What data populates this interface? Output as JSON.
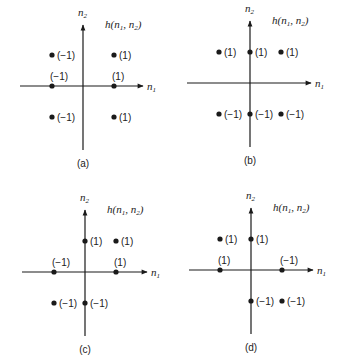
{
  "figure": {
    "panels": [
      {
        "id": "a",
        "caption": "(a)",
        "title": "h(n1, n2)",
        "origin": [
          83,
          86
        ],
        "axis": {
          "x_from": 20,
          "x_to": 143,
          "y_from": 25,
          "y_to": 150
        },
        "points": [
          {
            "dx": -1,
            "dy": 1,
            "value": "(−1)",
            "label_pos": "right"
          },
          {
            "dx": 1,
            "dy": 1,
            "value": "(1)",
            "label_pos": "right"
          },
          {
            "dx": -1,
            "dy": 0,
            "value": "(−1)",
            "label_pos": "above"
          },
          {
            "dx": 1,
            "dy": 0,
            "value": "(1)",
            "label_pos": "above"
          },
          {
            "dx": -1,
            "dy": -1,
            "value": "(−1)",
            "label_pos": "right"
          },
          {
            "dx": 1,
            "dy": -1,
            "value": "(1)",
            "label_pos": "right"
          }
        ]
      },
      {
        "id": "b",
        "caption": "(b)",
        "title": "h(n1, n2)",
        "origin": [
          250,
          83
        ],
        "axis": {
          "x_from": 187,
          "x_to": 311,
          "y_from": 21,
          "y_to": 147
        },
        "points": [
          {
            "dx": -1,
            "dy": 1,
            "value": "(1)",
            "label_pos": "right"
          },
          {
            "dx": 0,
            "dy": 1,
            "value": "(1)",
            "label_pos": "right"
          },
          {
            "dx": 1,
            "dy": 1,
            "value": "(1)",
            "label_pos": "right"
          },
          {
            "dx": -1,
            "dy": -1,
            "value": "(−1)",
            "label_pos": "right"
          },
          {
            "dx": 0,
            "dy": -1,
            "value": "(−1)",
            "label_pos": "right"
          },
          {
            "dx": 1,
            "dy": -1,
            "value": "(−1)",
            "label_pos": "right"
          }
        ]
      },
      {
        "id": "c",
        "caption": "(c)",
        "title": "h(n1, n2)",
        "origin": [
          85,
          272
        ],
        "axis": {
          "x_from": 22,
          "x_to": 147,
          "y_from": 210,
          "y_to": 336
        },
        "points": [
          {
            "dx": 0,
            "dy": 1,
            "value": "(1)",
            "label_pos": "right"
          },
          {
            "dx": 1,
            "dy": 1,
            "value": "(1)",
            "label_pos": "right"
          },
          {
            "dx": -1,
            "dy": 0,
            "value": "(−1)",
            "label_pos": "above"
          },
          {
            "dx": 1,
            "dy": 0,
            "value": "(1)",
            "label_pos": "above"
          },
          {
            "dx": -1,
            "dy": -1,
            "value": "(−1)",
            "label_pos": "right"
          },
          {
            "dx": 0,
            "dy": -1,
            "value": "(−1)",
            "label_pos": "right"
          }
        ]
      },
      {
        "id": "d",
        "caption": "(d)",
        "title": "h(n1, n2)",
        "origin": [
          251,
          270
        ],
        "axis": {
          "x_from": 189,
          "x_to": 313,
          "y_from": 208,
          "y_to": 334
        },
        "points": [
          {
            "dx": -1,
            "dy": 1,
            "value": "(1)",
            "label_pos": "right"
          },
          {
            "dx": 0,
            "dy": 1,
            "value": "(1)",
            "label_pos": "right"
          },
          {
            "dx": -1,
            "dy": 0,
            "value": "(1)",
            "label_pos": "above"
          },
          {
            "dx": 1,
            "dy": 0,
            "value": "(−1)",
            "label_pos": "above"
          },
          {
            "dx": 0,
            "dy": -1,
            "value": "(−1)",
            "label_pos": "right"
          },
          {
            "dx": 1,
            "dy": -1,
            "value": "(−1)",
            "label_pos": "right"
          }
        ]
      }
    ],
    "axis_labels": {
      "horizontal": "n",
      "horizontal_sub": "1",
      "vertical": "n",
      "vertical_sub": "2"
    },
    "spacing": 31,
    "colors": {
      "ink": "#1a1a1a",
      "background": "#ffffff"
    }
  }
}
